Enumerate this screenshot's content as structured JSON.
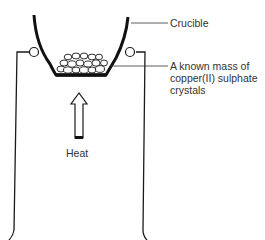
{
  "diagram": {
    "labels": {
      "crucible": "Crucible",
      "crystals_line1": "A known mass of",
      "crystals_line2": "copper(II) sulphate",
      "crystals_line3": "crystals",
      "heat": "Heat"
    },
    "components": [
      "crucible",
      "pipeclay-triangle",
      "tripod-stand",
      "crystals",
      "heat-arrow"
    ],
    "colors": {
      "line": "#1a1a1a",
      "text": "#333333",
      "background": "#ffffff"
    }
  }
}
